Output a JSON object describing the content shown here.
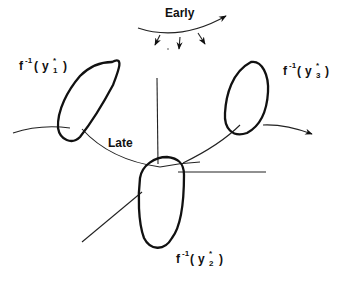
{
  "diagram": {
    "labels": {
      "early": "Early",
      "late": "Late"
    },
    "regions": [
      {
        "id": "y1",
        "func": "f",
        "exp": "-1",
        "open": "(",
        "var": "y",
        "star": "*",
        "sub": "1",
        "close": ")"
      },
      {
        "id": "y2",
        "func": "f",
        "exp": "-1",
        "open": "(",
        "var": "y",
        "star": "*",
        "sub": "2",
        "close": ")"
      },
      {
        "id": "y3",
        "func": "f",
        "exp": "-1",
        "open": "(",
        "var": "y",
        "star": "*",
        "sub": "3",
        "close": ")"
      }
    ],
    "colors": {
      "line": "#111111",
      "background": "#ffffff"
    }
  }
}
